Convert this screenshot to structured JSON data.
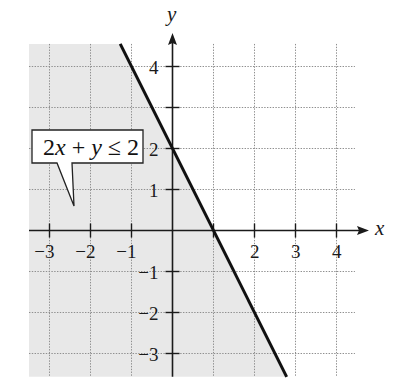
{
  "chart_data": {
    "type": "area",
    "title": "",
    "inequality": "2x + y ≤ 2",
    "boundary_line": {
      "equation": "2x + y = 2",
      "a": 2,
      "b": 1,
      "c": 2,
      "style": "solid",
      "y_intercept": 2,
      "x_intercept": 1
    },
    "shaded_side": "2x + y ≤ 2 (left / below the line)",
    "xlabel": "x",
    "ylabel": "y",
    "xlim": [
      -3.5,
      4.45
    ],
    "ylim": [
      -3.57,
      4.55
    ],
    "x_ticks": [
      -3,
      -2,
      -1,
      1,
      2,
      3,
      4
    ],
    "x_tick_labels": [
      "−3",
      "−2",
      "−1",
      "",
      "2",
      "3",
      "4"
    ],
    "y_ticks": [
      4,
      3,
      2,
      1,
      -1,
      -2,
      -3
    ],
    "y_tick_labels": [
      "4",
      "",
      "2",
      "1",
      "−1",
      "−2",
      "−3"
    ],
    "grid": true,
    "legend": null
  },
  "callout": {
    "parts": [
      {
        "text": "2"
      },
      {
        "text": "x"
      },
      {
        "text": " + "
      },
      {
        "text": "y"
      },
      {
        "text": " ≤ 2"
      }
    ]
  },
  "colors": {
    "shade": "#e8e8e8",
    "grid": "#8f8f8f",
    "axis": "#1a1a1a",
    "boundary": "#111111",
    "callout_fill": "#ffffff",
    "callout_stroke": "#222222"
  }
}
